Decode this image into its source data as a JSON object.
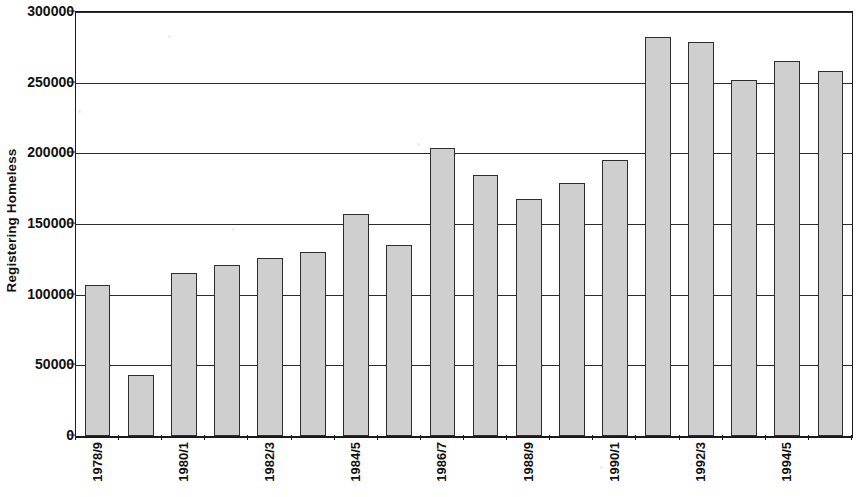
{
  "chart_data": {
    "type": "bar",
    "title": "",
    "xlabel": "",
    "ylabel": "Registering Homeless",
    "ylim": [
      0,
      300000
    ],
    "ytick_values": [
      0,
      50000,
      100000,
      150000,
      200000,
      250000,
      300000
    ],
    "ytick_labels": [
      "0",
      "50000",
      "100000",
      "150000",
      "200000",
      "250000",
      "300000"
    ],
    "grid": "horizontal",
    "legend": "none",
    "bar_color": "#cfcfcf",
    "bar_edge_color": "#2e2e2e",
    "axis_color": "#1a1a1a",
    "categories": [
      "1978/9",
      "1979/80",
      "1980/1",
      "1981/2",
      "1982/3",
      "1983/4",
      "1984/5",
      "1985/6",
      "1986/7",
      "1987/8",
      "1988/9",
      "1989/90",
      "1990/1",
      "1991/2",
      "1992/3",
      "1993/4",
      "1994/5",
      "1995/6"
    ],
    "xtick_labels_shown": [
      "1978/9",
      "1980/1",
      "1982/3",
      "1984/5",
      "1986/7",
      "1988/9",
      "1990/1",
      "1992/3",
      "1994/5"
    ],
    "values": [
      107000,
      43000,
      115000,
      121000,
      126000,
      130000,
      157000,
      135000,
      204000,
      185000,
      168000,
      179000,
      195000,
      282000,
      279000,
      252000,
      265000,
      258000
    ],
    "series": [
      {
        "name": "Registering Homeless",
        "values": [
          107000,
          43000,
          115000,
          121000,
          126000,
          130000,
          157000,
          135000,
          204000,
          185000,
          168000,
          179000,
          195000,
          282000,
          279000,
          252000,
          265000,
          258000
        ]
      }
    ]
  }
}
